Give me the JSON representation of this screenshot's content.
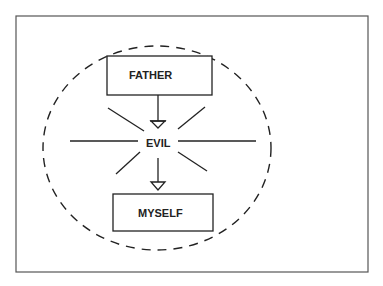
{
  "diagram": {
    "nodes": {
      "top": {
        "label": "FATHER"
      },
      "center": {
        "label": "EVIL"
      },
      "bottom": {
        "label": "MYSELF"
      }
    },
    "edges": [
      {
        "from": "FATHER",
        "to": "EVIL",
        "style": "open-triangle-arrow"
      },
      {
        "from": "EVIL",
        "to": "MYSELF",
        "style": "open-triangle-arrow"
      }
    ],
    "enclosure": "dashed-ellipse",
    "center_decoration": "radiating-lines"
  },
  "colors": {
    "stroke": "#222222",
    "frame": "#555555",
    "background": "#ffffff"
  }
}
